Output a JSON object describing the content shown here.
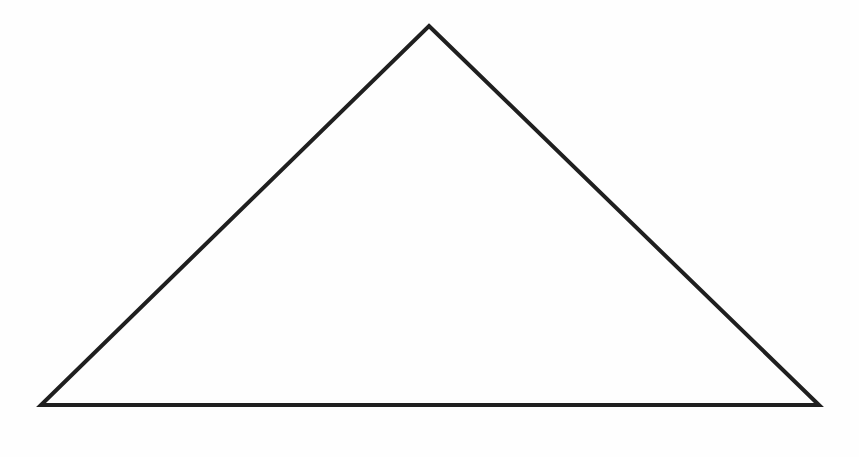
{
  "canvas": {
    "width": 859,
    "height": 457,
    "background_color": "#fefefe",
    "title": "Triangle outline figure"
  },
  "figure": {
    "name": "triangle",
    "type": "polygon",
    "sides": 3,
    "stroke_color": "#1f1f1f",
    "fill_color": "none",
    "stroke_width": 4,
    "stroke_linejoin": "miter",
    "points_attr": "429,26 819,405 41,405",
    "vertices": [
      {
        "label": "apex",
        "x": 429,
        "y": 26
      },
      {
        "label": "base-right",
        "x": 819,
        "y": 405
      },
      {
        "label": "base-left",
        "x": 41,
        "y": 405
      }
    ],
    "measurements": {
      "base_width_px": 778,
      "height_px": 379,
      "apex_offset_from_left_px": 388
    }
  },
  "annotations": {
    "labels": [],
    "text_present": false
  }
}
